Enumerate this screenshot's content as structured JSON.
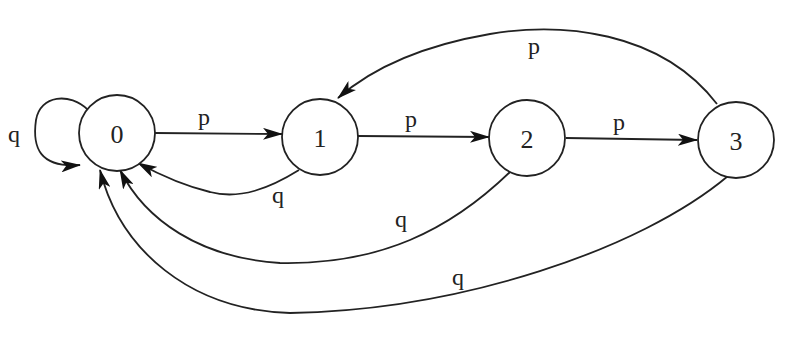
{
  "diagram": {
    "type": "state-machine",
    "nodes": [
      {
        "id": "0",
        "label": "0"
      },
      {
        "id": "1",
        "label": "1"
      },
      {
        "id": "2",
        "label": "2"
      },
      {
        "id": "3",
        "label": "3"
      }
    ],
    "edges": [
      {
        "from": "0",
        "to": "0",
        "label": "q"
      },
      {
        "from": "0",
        "to": "1",
        "label": "p"
      },
      {
        "from": "1",
        "to": "2",
        "label": "p"
      },
      {
        "from": "2",
        "to": "3",
        "label": "p"
      },
      {
        "from": "3",
        "to": "1",
        "label": "p"
      },
      {
        "from": "1",
        "to": "0",
        "label": "q"
      },
      {
        "from": "2",
        "to": "0",
        "label": "q"
      },
      {
        "from": "3",
        "to": "0",
        "label": "q"
      }
    ]
  }
}
